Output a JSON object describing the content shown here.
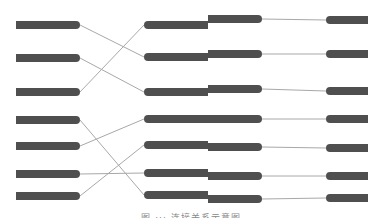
{
  "colors": {
    "bar": "#4f4f4f",
    "link": "#a8a8a8",
    "background": "#ffffff"
  },
  "diagram": {
    "left_column": [
      "L1",
      "L2",
      "L3",
      "L4",
      "L5",
      "L6",
      "L7"
    ],
    "middle_column": [
      "M1",
      "M2",
      "M3",
      "M4",
      "M5",
      "M6",
      "M7"
    ],
    "right_column": [
      "R1",
      "R2",
      "R3",
      "R4",
      "R5",
      "R6",
      "R7"
    ],
    "left_to_middle_links": [
      {
        "from": 1,
        "to": 2
      },
      {
        "from": 2,
        "to": 3
      },
      {
        "from": 3,
        "to": 1
      },
      {
        "from": 4,
        "to": 7
      },
      {
        "from": 5,
        "to": 4
      },
      {
        "from": 6,
        "to": 6
      },
      {
        "from": 7,
        "to": 5
      }
    ],
    "middle_to_right_links": [
      {
        "from": 1,
        "to": 1
      },
      {
        "from": 2,
        "to": 2
      },
      {
        "from": 3,
        "to": 3
      },
      {
        "from": 4,
        "to": 4
      },
      {
        "from": 5,
        "to": 5
      },
      {
        "from": 6,
        "to": 6
      },
      {
        "from": 7,
        "to": 7
      }
    ]
  },
  "caption": "图 ··· 连接关系示意图"
}
